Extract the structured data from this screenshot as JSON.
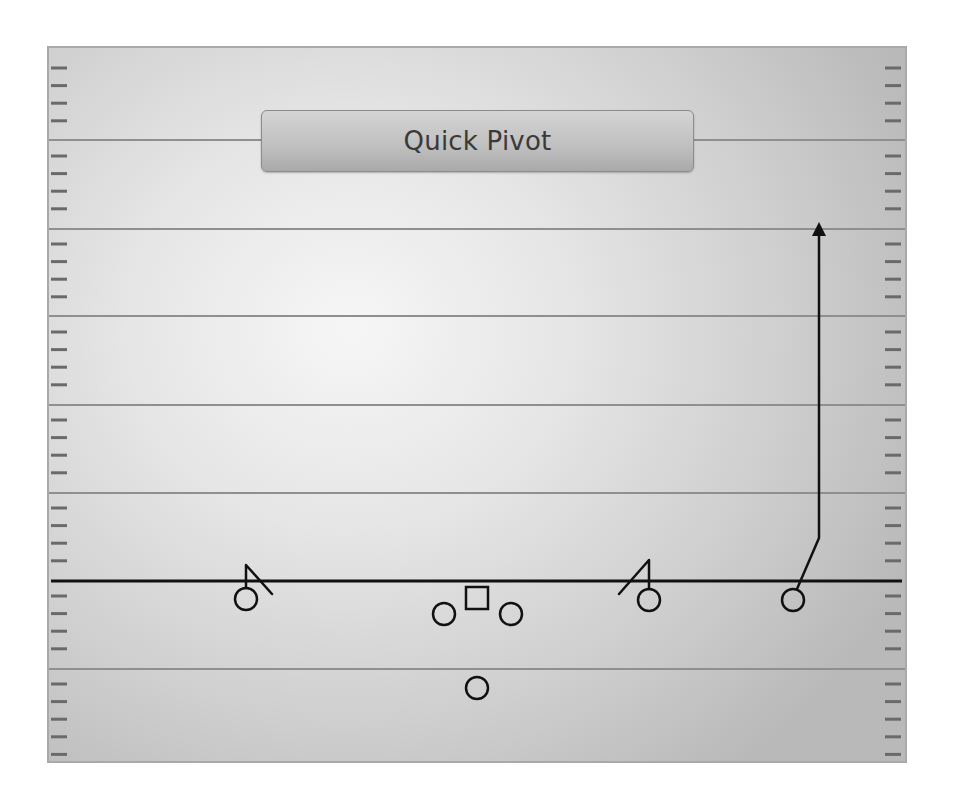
{
  "play": {
    "title": "Quick Pivot",
    "colors": {
      "ink": "#111111",
      "yard_line": "#8f8f8f",
      "hash": "#6a6a6a",
      "field_light": "#f6f6f6",
      "field_dark": "#b9b9b9"
    },
    "field": {
      "left": 47,
      "top": 46,
      "right": 907,
      "bottom": 763,
      "yard_lines_y": [
        140,
        229,
        316,
        405,
        493,
        669
      ],
      "line_of_scrimmage_y": 581,
      "hash_spacing": 17.6
    },
    "players": [
      {
        "id": "left-receiver",
        "shape": "circle",
        "x": 246,
        "y": 599
      },
      {
        "id": "left-guard",
        "shape": "circle",
        "x": 444,
        "y": 614
      },
      {
        "id": "center",
        "shape": "square",
        "x": 477,
        "y": 598
      },
      {
        "id": "right-guard",
        "shape": "circle",
        "x": 511,
        "y": 614
      },
      {
        "id": "slot-receiver",
        "shape": "circle",
        "x": 649,
        "y": 600
      },
      {
        "id": "wide-receiver",
        "shape": "circle",
        "x": 793,
        "y": 600
      },
      {
        "id": "running-back",
        "shape": "circle",
        "x": 477,
        "y": 688
      }
    ],
    "routes": [
      {
        "player": "left-receiver",
        "type": "pivot",
        "points": [
          [
            246,
            588
          ],
          [
            246,
            565
          ],
          [
            272,
            594
          ]
        ]
      },
      {
        "player": "slot-receiver",
        "type": "pivot",
        "points": [
          [
            649,
            589
          ],
          [
            649,
            560
          ],
          [
            619,
            594
          ]
        ]
      },
      {
        "player": "wide-receiver",
        "type": "go",
        "points": [
          [
            797,
            589
          ],
          [
            819,
            538
          ],
          [
            819,
            234
          ]
        ],
        "arrow": true
      }
    ]
  }
}
